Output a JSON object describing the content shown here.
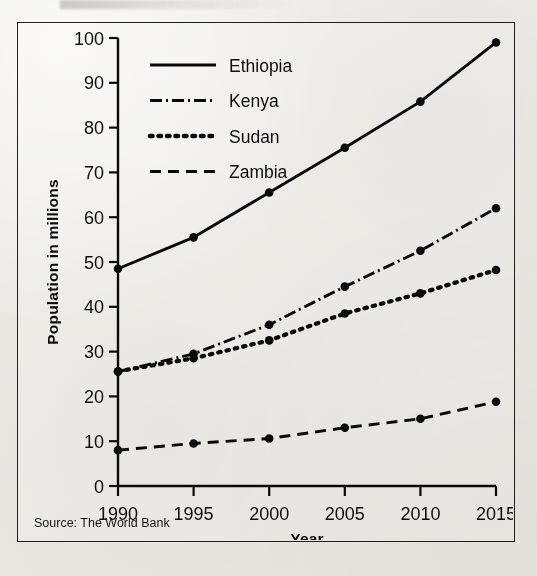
{
  "figure": {
    "source_note": "Source: The World Bank"
  },
  "chart_data": {
    "type": "line",
    "title": "",
    "xlabel": "Year",
    "ylabel": "Population in millions",
    "x": [
      1990,
      1995,
      2000,
      2005,
      2010,
      2015
    ],
    "xticklabels": [
      "1990",
      "1995",
      "2000",
      "2005",
      "2010",
      "2015"
    ],
    "yticks": [
      0,
      10,
      20,
      30,
      40,
      50,
      60,
      70,
      80,
      90,
      100
    ],
    "yticklabels": [
      "0",
      "10",
      "20",
      "30",
      "40",
      "50",
      "60",
      "70",
      "80",
      "90",
      "100"
    ],
    "xlim": [
      1990,
      2015
    ],
    "ylim": [
      0,
      100
    ],
    "grid": false,
    "legend_position": "upper left",
    "markers": "filled-circle",
    "color": "#101010",
    "series": [
      {
        "name": "Ethiopia",
        "linestyle": "solid",
        "dash_pattern": "none",
        "values": [
          48.5,
          55.5,
          65.5,
          75.5,
          85.8,
          99.0
        ]
      },
      {
        "name": "Kenya",
        "linestyle": "dash-dot",
        "dash_pattern": "12,4,2,4",
        "values": [
          25.5,
          29.5,
          36.0,
          44.5,
          52.5,
          62.0
        ]
      },
      {
        "name": "Sudan",
        "linestyle": "dotted",
        "dash_pattern": "2.5,6",
        "values": [
          25.6,
          28.5,
          32.5,
          38.5,
          43.0,
          48.2
        ]
      },
      {
        "name": "Zambia",
        "linestyle": "dashed",
        "dash_pattern": "11,7",
        "values": [
          8.0,
          9.5,
          10.6,
          13.0,
          15.0,
          18.8
        ]
      }
    ]
  }
}
